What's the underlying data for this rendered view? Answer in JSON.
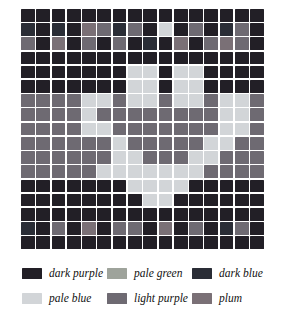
{
  "chart_data": {
    "type": "heatmap",
    "title": "",
    "subtitle": "",
    "xlabel": "",
    "ylabel": "",
    "grid": true,
    "legend_position": "bottom",
    "rows": 17,
    "columns": 16,
    "palette": {
      "dark purple": "#221f26",
      "pale blue": "#d2d5d8",
      "pale green": "#9ea39b",
      "light purple": "#6e6a72",
      "dark blue": "#2a2d36",
      "plum": "#7a7076"
    },
    "legend_order": [
      "dark purple",
      "pale green",
      "dark blue",
      "pale blue",
      "light purple",
      "plum"
    ],
    "cell_codes": {
      "0": "dark purple",
      "1": "pale blue",
      "2": "pale green",
      "3": "light purple",
      "4": "dark blue",
      "5": "plum"
    },
    "cells": [
      [
        0,
        0,
        0,
        0,
        0,
        0,
        0,
        0,
        0,
        0,
        0,
        0,
        0,
        0,
        0,
        0
      ],
      [
        4,
        0,
        4,
        0,
        5,
        3,
        4,
        3,
        0,
        1,
        0,
        3,
        0,
        4,
        3,
        0
      ],
      [
        3,
        0,
        5,
        0,
        3,
        0,
        3,
        0,
        4,
        0,
        5,
        0,
        3,
        5,
        3,
        0
      ],
      [
        0,
        0,
        0,
        0,
        0,
        0,
        0,
        0,
        0,
        0,
        0,
        0,
        0,
        0,
        0,
        0
      ],
      [
        0,
        0,
        0,
        0,
        0,
        0,
        0,
        1,
        1,
        0,
        1,
        1,
        0,
        0,
        0,
        0
      ],
      [
        0,
        0,
        0,
        0,
        0,
        0,
        0,
        1,
        1,
        0,
        1,
        1,
        0,
        0,
        0,
        0
      ],
      [
        3,
        3,
        3,
        3,
        1,
        1,
        3,
        1,
        1,
        3,
        1,
        1,
        3,
        1,
        1,
        3
      ],
      [
        3,
        3,
        3,
        3,
        1,
        3,
        3,
        3,
        3,
        3,
        3,
        3,
        3,
        1,
        1,
        3
      ],
      [
        3,
        3,
        3,
        3,
        1,
        1,
        3,
        3,
        3,
        3,
        3,
        3,
        3,
        1,
        1,
        3
      ],
      [
        3,
        3,
        3,
        3,
        3,
        3,
        1,
        3,
        3,
        3,
        3,
        3,
        1,
        1,
        3,
        3
      ],
      [
        3,
        3,
        3,
        3,
        3,
        3,
        1,
        1,
        3,
        3,
        3,
        1,
        1,
        3,
        3,
        3
      ],
      [
        3,
        3,
        3,
        3,
        3,
        1,
        1,
        1,
        1,
        1,
        1,
        1,
        3,
        3,
        3,
        3
      ],
      [
        0,
        0,
        0,
        0,
        0,
        0,
        0,
        1,
        1,
        1,
        1,
        0,
        0,
        0,
        0,
        0
      ],
      [
        0,
        0,
        0,
        0,
        0,
        0,
        0,
        0,
        1,
        1,
        0,
        0,
        0,
        0,
        0,
        0
      ],
      [
        0,
        0,
        0,
        0,
        0,
        0,
        0,
        0,
        0,
        0,
        0,
        0,
        0,
        0,
        0,
        0
      ],
      [
        4,
        0,
        3,
        0,
        5,
        0,
        3,
        3,
        0,
        5,
        0,
        3,
        0,
        4,
        3,
        0
      ],
      [
        0,
        0,
        0,
        0,
        0,
        0,
        0,
        0,
        0,
        0,
        0,
        0,
        0,
        0,
        0,
        0
      ]
    ]
  },
  "legend": {
    "items": [
      {
        "label": "dark purple",
        "color": "#221f26"
      },
      {
        "label": "pale green",
        "color": "#9ea39b"
      },
      {
        "label": "dark blue",
        "color": "#2a2d36"
      },
      {
        "label": "pale blue",
        "color": "#d2d5d8"
      },
      {
        "label": "light purple",
        "color": "#6e6a72"
      },
      {
        "label": "plum",
        "color": "#7a7076"
      }
    ]
  }
}
